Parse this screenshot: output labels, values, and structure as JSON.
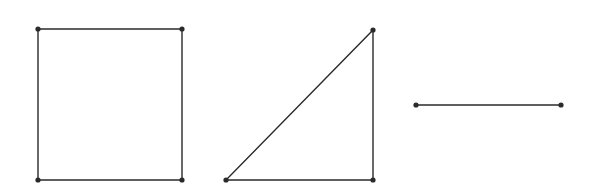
{
  "colors": {
    "stroke": "#2a2a2a",
    "vertex": "#2a2a2a",
    "background": "#ffffff"
  },
  "shapes": [
    {
      "name": "square",
      "type": "polygon",
      "points": [
        [
          38,
          29
        ],
        [
          182,
          29
        ],
        [
          182,
          180
        ],
        [
          38,
          180
        ]
      ],
      "vertices": [
        [
          38,
          29
        ],
        [
          182,
          29
        ],
        [
          182,
          180
        ],
        [
          38,
          180
        ]
      ]
    },
    {
      "name": "right-triangle",
      "type": "polygon",
      "points": [
        [
          373,
          30
        ],
        [
          373,
          180
        ],
        [
          226,
          180
        ]
      ],
      "vertices": [
        [
          373,
          30
        ],
        [
          373,
          180
        ],
        [
          226,
          180
        ]
      ]
    },
    {
      "name": "line-segment",
      "type": "line",
      "points": [
        [
          416,
          105
        ],
        [
          561,
          105
        ]
      ],
      "vertices": [
        [
          416,
          105
        ],
        [
          561,
          105
        ]
      ]
    }
  ]
}
